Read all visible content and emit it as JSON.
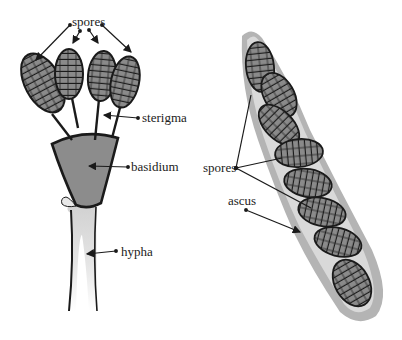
{
  "diagram": {
    "left": {
      "title": "basidium structure",
      "labels": {
        "spores": "spores",
        "sterigma": "sterigma",
        "basidium": "basidium",
        "hypha": "hypha"
      }
    },
    "right": {
      "title": "ascus structure",
      "labels": {
        "spores": "spores",
        "ascus": "ascus"
      },
      "spore_count": 8
    },
    "colors": {
      "spore_fill": "#8a8a8a",
      "basidium_fill": "#8c8c8c",
      "hypha_fill": "#dcdcdc",
      "ascus_outer": "#b4b4b4",
      "ascus_inner": "#d9d9d9",
      "outline": "#1a1a1a"
    }
  }
}
